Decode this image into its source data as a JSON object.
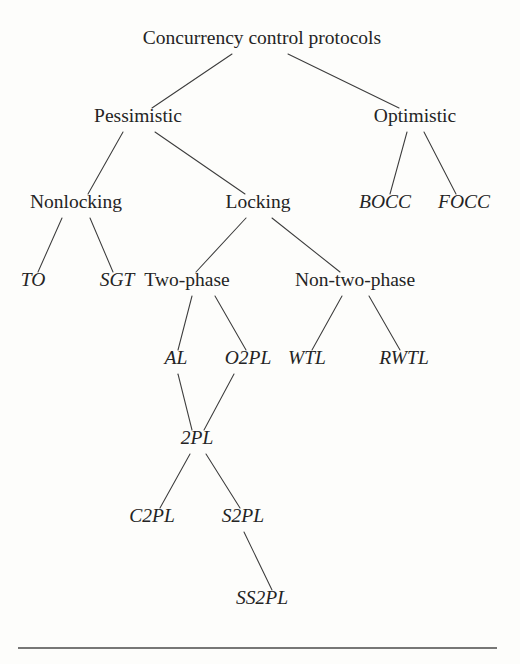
{
  "figure": {
    "title": "Concurrency control protocols",
    "background_color": "#fdfdfb",
    "line_color": "#3c3c3c",
    "text_color": "#242424",
    "rule_color": "#4a4a4a"
  },
  "nodes": [
    {
      "id": "root",
      "label": "Concurrency control protocols",
      "x": 262,
      "y": 44,
      "size": 19.5,
      "style": "upright",
      "level": 0
    },
    {
      "id": "pessimistic",
      "label": "Pessimistic",
      "x": 138,
      "y": 122,
      "size": 19.5,
      "style": "upright",
      "level": 1
    },
    {
      "id": "optimistic",
      "label": "Optimistic",
      "x": 415,
      "y": 122,
      "size": 19.5,
      "style": "upright",
      "level": 1
    },
    {
      "id": "nonlocking",
      "label": "Nonlocking",
      "x": 76,
      "y": 208,
      "size": 19.5,
      "style": "upright",
      "level": 2
    },
    {
      "id": "locking",
      "label": "Locking",
      "x": 258,
      "y": 208,
      "size": 19.5,
      "style": "upright",
      "level": 2
    },
    {
      "id": "bocc",
      "label": "BOCC",
      "x": 385,
      "y": 208,
      "size": 19.5,
      "style": "italic",
      "level": 2
    },
    {
      "id": "focc",
      "label": "FOCC",
      "x": 464,
      "y": 208,
      "size": 19.5,
      "style": "italic",
      "level": 2
    },
    {
      "id": "to",
      "label": "TO",
      "x": 33,
      "y": 286,
      "size": 19.5,
      "style": "italic",
      "level": 3
    },
    {
      "id": "sgt",
      "label": "SGT",
      "x": 117,
      "y": 286,
      "size": 19.5,
      "style": "italic",
      "level": 3
    },
    {
      "id": "twophase",
      "label": "Two-phase",
      "x": 187,
      "y": 286,
      "size": 19.5,
      "style": "upright",
      "level": 3
    },
    {
      "id": "nontwophase",
      "label": "Non-two-phase",
      "x": 355,
      "y": 286,
      "size": 19.5,
      "style": "upright",
      "level": 3
    },
    {
      "id": "al",
      "label": "AL",
      "x": 176,
      "y": 364,
      "size": 19.5,
      "style": "italic",
      "level": 4
    },
    {
      "id": "o2pl",
      "label": "O2PL",
      "x": 248,
      "y": 364,
      "size": 19.5,
      "style": "italic",
      "level": 4
    },
    {
      "id": "wtl",
      "label": "WTL",
      "x": 307,
      "y": 364,
      "size": 19.5,
      "style": "italic",
      "level": 4
    },
    {
      "id": "rwtl",
      "label": "RWTL",
      "x": 404,
      "y": 364,
      "size": 19.5,
      "style": "italic",
      "level": 4
    },
    {
      "id": "twopl",
      "label": "2PL",
      "x": 197,
      "y": 444,
      "size": 19.5,
      "style": "italic",
      "level": 5
    },
    {
      "id": "c2pl",
      "label": "C2PL",
      "x": 152,
      "y": 522,
      "size": 19.5,
      "style": "italic",
      "level": 6
    },
    {
      "id": "s2pl",
      "label": "S2PL",
      "x": 243,
      "y": 522,
      "size": 19.5,
      "style": "italic",
      "level": 6
    },
    {
      "id": "ss2pl",
      "label": "SS2PL",
      "x": 262,
      "y": 604,
      "size": 19.5,
      "style": "italic",
      "level": 7
    }
  ],
  "edges": [
    {
      "from": "root",
      "to": "pessimistic",
      "x1": 232,
      "y1": 54,
      "x2": 152,
      "y2": 108
    },
    {
      "from": "root",
      "to": "optimistic",
      "x1": 288,
      "y1": 54,
      "x2": 399,
      "y2": 108
    },
    {
      "from": "pessimistic",
      "to": "nonlocking",
      "x1": 123,
      "y1": 132,
      "x2": 88,
      "y2": 194
    },
    {
      "from": "pessimistic",
      "to": "locking",
      "x1": 155,
      "y1": 132,
      "x2": 245,
      "y2": 194
    },
    {
      "from": "optimistic",
      "to": "bocc",
      "x1": 407,
      "y1": 132,
      "x2": 390,
      "y2": 194
    },
    {
      "from": "optimistic",
      "to": "focc",
      "x1": 424,
      "y1": 132,
      "x2": 456,
      "y2": 194
    },
    {
      "from": "nonlocking",
      "to": "to",
      "x1": 62,
      "y1": 218,
      "x2": 38,
      "y2": 272
    },
    {
      "from": "nonlocking",
      "to": "sgt",
      "x1": 90,
      "y1": 218,
      "x2": 113,
      "y2": 272
    },
    {
      "from": "locking",
      "to": "twophase",
      "x1": 246,
      "y1": 218,
      "x2": 196,
      "y2": 272
    },
    {
      "from": "locking",
      "to": "nontwophase",
      "x1": 272,
      "y1": 218,
      "x2": 340,
      "y2": 272
    },
    {
      "from": "twophase",
      "to": "al",
      "x1": 192,
      "y1": 296,
      "x2": 178,
      "y2": 350
    },
    {
      "from": "twophase",
      "to": "o2pl",
      "x1": 215,
      "y1": 296,
      "x2": 246,
      "y2": 350
    },
    {
      "from": "nontwophase",
      "to": "wtl",
      "x1": 342,
      "y1": 296,
      "x2": 312,
      "y2": 350
    },
    {
      "from": "nontwophase",
      "to": "rwtl",
      "x1": 369,
      "y1": 296,
      "x2": 400,
      "y2": 350
    },
    {
      "from": "al",
      "to": "twopl",
      "x1": 178,
      "y1": 374,
      "x2": 192,
      "y2": 430
    },
    {
      "from": "o2pl",
      "to": "twopl",
      "x1": 234,
      "y1": 374,
      "x2": 204,
      "y2": 430
    },
    {
      "from": "twopl",
      "to": "c2pl",
      "x1": 190,
      "y1": 454,
      "x2": 160,
      "y2": 508
    },
    {
      "from": "twopl",
      "to": "s2pl",
      "x1": 206,
      "y1": 454,
      "x2": 240,
      "y2": 508
    },
    {
      "from": "s2pl",
      "to": "ss2pl",
      "x1": 244,
      "y1": 532,
      "x2": 272,
      "y2": 590
    }
  ],
  "footer_rule": {
    "x1": 18,
    "y1": 648,
    "x2": 497,
    "y2": 648
  },
  "tree_structure": {
    "label": "Concurrency control protocols",
    "children": [
      {
        "label": "Pessimistic",
        "children": [
          {
            "label": "Nonlocking",
            "children": [
              {
                "label": "TO"
              },
              {
                "label": "SGT"
              }
            ]
          },
          {
            "label": "Locking",
            "children": [
              {
                "label": "Two-phase",
                "children": [
                  {
                    "label": "AL"
                  },
                  {
                    "label": "O2PL"
                  }
                ]
              },
              {
                "label": "Non-two-phase",
                "children": [
                  {
                    "label": "WTL"
                  },
                  {
                    "label": "RWTL"
                  }
                ]
              }
            ]
          }
        ]
      },
      {
        "label": "Optimistic",
        "children": [
          {
            "label": "BOCC"
          },
          {
            "label": "FOCC"
          }
        ]
      }
    ],
    "convergences": [
      {
        "label": "2PL",
        "parents": [
          "AL",
          "O2PL"
        ],
        "children": [
          {
            "label": "C2PL"
          },
          {
            "label": "S2PL",
            "children": [
              {
                "label": "SS2PL"
              }
            ]
          }
        ]
      }
    ]
  }
}
